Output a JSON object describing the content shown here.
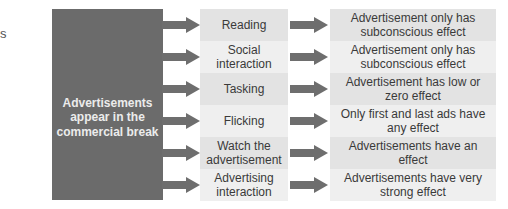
{
  "edge_fragment": "s",
  "source": {
    "label": "Advertisements appear in the commercial break",
    "color": "#6b6b6b"
  },
  "arrow_color": "#6e6e6e",
  "rows": [
    {
      "activity": "Reading",
      "effect": "Advertisement only has subconscious effect",
      "shade": "dark"
    },
    {
      "activity": "Social interaction",
      "effect": "Advertisement only has subconscious effect",
      "shade": "light"
    },
    {
      "activity": "Tasking",
      "effect": "Advertisement has low or zero effect",
      "shade": "dark"
    },
    {
      "activity": "Flicking",
      "effect": "Only first and last ads have any effect",
      "shade": "light"
    },
    {
      "activity": "Watch the advertisement",
      "effect": "Advertisements have an effect",
      "shade": "dark"
    },
    {
      "activity": "Advertising interaction",
      "effect": "Advertisements have very strong effect",
      "shade": "light"
    }
  ]
}
